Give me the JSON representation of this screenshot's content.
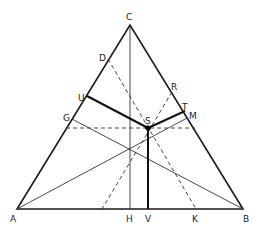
{
  "diagram": {
    "type": "ternary-triangle-construction",
    "points": {
      "A": {
        "label": "A",
        "x": 17,
        "y": 209,
        "lx": 10,
        "ly": 222
      },
      "B": {
        "label": "B",
        "x": 243,
        "y": 209,
        "lx": 243,
        "ly": 222
      },
      "C": {
        "label": "C",
        "x": 130,
        "y": 25,
        "lx": 126,
        "ly": 20
      },
      "D": {
        "label": "D",
        "x": 108,
        "y": 59,
        "lx": 99,
        "ly": 58
      },
      "U": {
        "label": "U",
        "x": 87,
        "y": 96,
        "lx": 78,
        "ly": 96
      },
      "G": {
        "label": "G",
        "x": 72,
        "y": 119,
        "lx": 63,
        "ly": 120
      },
      "R": {
        "label": "R",
        "x": 172,
        "y": 92,
        "lx": 171,
        "ly": 90
      },
      "T": {
        "label": "T",
        "x": 185,
        "y": 111,
        "lx": 182,
        "ly": 110
      },
      "M": {
        "label": "M",
        "x": 187,
        "y": 118,
        "lx": 189,
        "ly": 118
      },
      "S": {
        "label": "S",
        "x": 148,
        "y": 128,
        "lx": 145,
        "ly": 124
      },
      "H": {
        "label": "H",
        "x": 130,
        "y": 209,
        "lx": 126,
        "ly": 222
      },
      "V": {
        "label": "V",
        "x": 149,
        "y": 209,
        "lx": 145,
        "ly": 222
      },
      "K": {
        "label": "K",
        "x": 196,
        "y": 209,
        "lx": 192,
        "ly": 222
      }
    }
  }
}
